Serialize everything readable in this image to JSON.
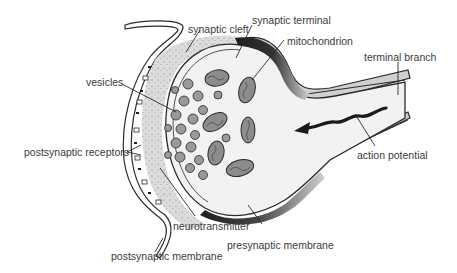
{
  "diagram": {
    "colors": {
      "background": "#ffffff",
      "outline": "#2a2a2a",
      "cleft_fill": "#dcdcdc",
      "terminal_fill": "#f2f2f2",
      "membrane_shade": "#1e1e1e",
      "organelle_fill": "#8c8c8c",
      "label_text": "#3a3a3a"
    },
    "labels": {
      "synaptic_cleft": "synaptic cleft",
      "synaptic_terminal": "synaptic terminal",
      "mitochondrion": "mitochondrion",
      "terminal_branch": "terminal branch",
      "vesicles": "vesicles",
      "postsynaptic_receptors": "postsynaptic receptors",
      "action_potential": "action potential",
      "neurotransmitter": "neurotransmitter",
      "postsynaptic_membrane": "postsynaptic membrane",
      "presynaptic_membrane": "presynaptic membrane"
    }
  }
}
